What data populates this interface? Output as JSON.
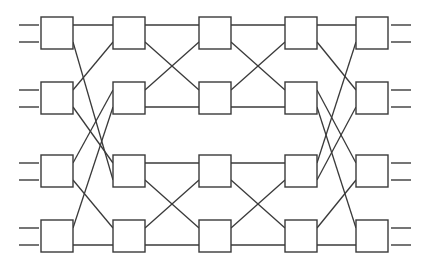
{
  "diagram": {
    "type": "benes-network",
    "canvas": {
      "width": 425,
      "height": 268,
      "background": "#ffffff"
    },
    "stroke_color": "#3a3a3a",
    "box_size": 32,
    "columns_x": [
      41,
      113,
      199,
      285,
      356
    ],
    "rows_y": [
      17,
      82,
      155,
      220
    ],
    "port_offsets": [
      8,
      25
    ],
    "inputs": {
      "x1": 19,
      "x2": 39,
      "count_per_box": 2
    },
    "outputs": {
      "x1": 391,
      "x2": 411,
      "count_per_box": 2
    },
    "stages": [
      {
        "name": "stage-1",
        "from_col": 0,
        "to_col": 1,
        "links": [
          {
            "from": [
              0,
              0
            ],
            "to": [
              0,
              0
            ]
          },
          {
            "from": [
              0,
              1
            ],
            "to": [
              2,
              1
            ]
          },
          {
            "from": [
              1,
              0
            ],
            "to": [
              0,
              1
            ]
          },
          {
            "from": [
              1,
              1
            ],
            "to": [
              2,
              0
            ]
          },
          {
            "from": [
              2,
              0
            ],
            "to": [
              1,
              0
            ]
          },
          {
            "from": [
              2,
              1
            ],
            "to": [
              3,
              0
            ]
          },
          {
            "from": [
              3,
              0
            ],
            "to": [
              1,
              1
            ]
          },
          {
            "from": [
              3,
              1
            ],
            "to": [
              3,
              1
            ]
          }
        ]
      },
      {
        "name": "stage-2",
        "from_col": 1,
        "to_col": 2,
        "links": [
          {
            "from": [
              0,
              0
            ],
            "to": [
              0,
              0
            ]
          },
          {
            "from": [
              0,
              1
            ],
            "to": [
              1,
              0
            ]
          },
          {
            "from": [
              1,
              0
            ],
            "to": [
              0,
              1
            ]
          },
          {
            "from": [
              1,
              1
            ],
            "to": [
              1,
              1
            ]
          },
          {
            "from": [
              2,
              0
            ],
            "to": [
              2,
              0
            ]
          },
          {
            "from": [
              2,
              1
            ],
            "to": [
              3,
              0
            ]
          },
          {
            "from": [
              3,
              0
            ],
            "to": [
              2,
              1
            ]
          },
          {
            "from": [
              3,
              1
            ],
            "to": [
              3,
              1
            ]
          }
        ]
      },
      {
        "name": "stage-3",
        "from_col": 2,
        "to_col": 3,
        "links": [
          {
            "from": [
              0,
              0
            ],
            "to": [
              0,
              0
            ]
          },
          {
            "from": [
              0,
              1
            ],
            "to": [
              1,
              0
            ]
          },
          {
            "from": [
              1,
              0
            ],
            "to": [
              0,
              1
            ]
          },
          {
            "from": [
              1,
              1
            ],
            "to": [
              1,
              1
            ]
          },
          {
            "from": [
              2,
              0
            ],
            "to": [
              2,
              0
            ]
          },
          {
            "from": [
              2,
              1
            ],
            "to": [
              3,
              0
            ]
          },
          {
            "from": [
              3,
              0
            ],
            "to": [
              2,
              1
            ]
          },
          {
            "from": [
              3,
              1
            ],
            "to": [
              3,
              1
            ]
          }
        ]
      },
      {
        "name": "stage-4",
        "from_col": 3,
        "to_col": 4,
        "links": [
          {
            "from": [
              0,
              0
            ],
            "to": [
              0,
              0
            ]
          },
          {
            "from": [
              0,
              1
            ],
            "to": [
              1,
              0
            ]
          },
          {
            "from": [
              1,
              0
            ],
            "to": [
              2,
              0
            ]
          },
          {
            "from": [
              1,
              1
            ],
            "to": [
              3,
              0
            ]
          },
          {
            "from": [
              2,
              0
            ],
            "to": [
              0,
              1
            ]
          },
          {
            "from": [
              2,
              1
            ],
            "to": [
              1,
              1
            ]
          },
          {
            "from": [
              3,
              0
            ],
            "to": [
              2,
              1
            ]
          },
          {
            "from": [
              3,
              1
            ],
            "to": [
              3,
              1
            ]
          }
        ]
      }
    ]
  }
}
